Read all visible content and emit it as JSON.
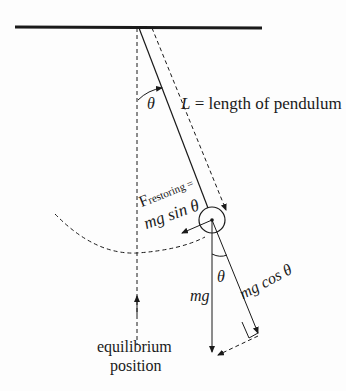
{
  "diagram": {
    "labels": {
      "theta_top": "θ",
      "length_label_var": "L",
      "length_label_text": " = length of pendulum",
      "f_restoring_main": "F",
      "f_restoring_sub": "restoring",
      "f_restoring_eq": " =",
      "mg_sin": "mg sin θ",
      "theta_bottom": "θ",
      "mg": "mg",
      "mg_cos": "mg cos θ",
      "equilibrium_line1": "equilibrium",
      "equilibrium_line2": "position"
    },
    "colors": {
      "line": "#1a1a1a",
      "background": "#fdfdfd"
    }
  }
}
